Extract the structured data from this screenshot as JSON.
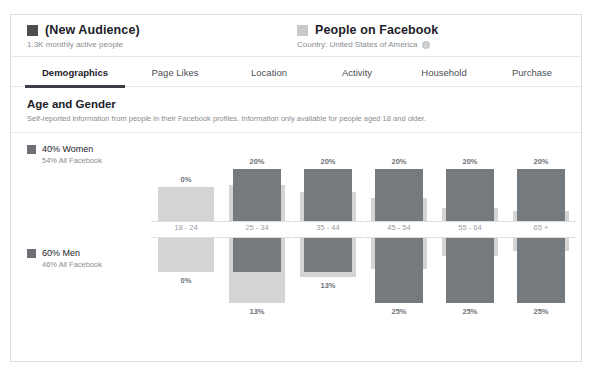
{
  "header": {
    "left": {
      "swatch_color": "#4d4d4d",
      "title": "(New Audience)",
      "subtitle": "1.3K monthly active people"
    },
    "right": {
      "swatch_color": "#c9c9c9",
      "title": "People on Facebook",
      "subtitle": "Country: United States of America",
      "info_icon": "info-icon"
    }
  },
  "tabs": [
    {
      "label": "Demographics",
      "active": true
    },
    {
      "label": "Page Likes",
      "active": false
    },
    {
      "label": "Location",
      "active": false
    },
    {
      "label": "Activity",
      "active": false
    },
    {
      "label": "Household",
      "active": false
    },
    {
      "label": "Purchase",
      "active": false
    }
  ],
  "section": {
    "title": "Age and Gender",
    "subtitle": "Self-reported information from people in their Facebook profiles. Information only available for people aged 18 and older."
  },
  "legend": {
    "women": {
      "main": "40% Women",
      "sub": "54% All Facebook"
    },
    "men": {
      "main": "60% Men",
      "sub": "46% All Facebook"
    }
  },
  "chart_data": {
    "type": "bar",
    "title": "Age and Gender",
    "xlabel": "",
    "ylabel": "",
    "grid": false,
    "legend_position": "left",
    "categories": [
      "18 - 24",
      "25 - 34",
      "35 - 44",
      "45 - 54",
      "55 - 64",
      "65 +"
    ],
    "series": [
      {
        "name": "40% Women",
        "group": "women",
        "color": "#757a7f",
        "values": [
          0,
          20,
          20,
          20,
          20,
          20
        ],
        "labels": [
          "0%",
          "20%",
          "20%",
          "20%",
          "20%",
          "20%"
        ]
      },
      {
        "name": "54% All Facebook (Women)",
        "group": "women",
        "color": "#d4d4d4",
        "values": [
          13,
          14,
          11,
          9,
          5,
          4
        ],
        "labels": [
          "",
          "",
          "",
          "",
          "",
          ""
        ]
      },
      {
        "name": "60% Men",
        "group": "men",
        "color": "#757a7f",
        "values": [
          0,
          13,
          13,
          25,
          25,
          25
        ],
        "labels": [
          "0%",
          "13%",
          "13%",
          "25%",
          "25%",
          "25%"
        ]
      },
      {
        "name": "46% All Facebook (Men)",
        "group": "men",
        "color": "#d4d4d4",
        "values": [
          13,
          25,
          15,
          12,
          7,
          5
        ],
        "labels": [
          "",
          "",
          "",
          "",
          "",
          ""
        ]
      }
    ]
  }
}
